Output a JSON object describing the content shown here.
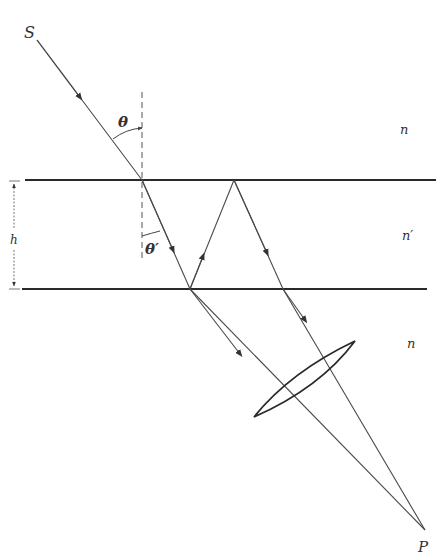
{
  "diagram": {
    "type": "optics-ray-diagram",
    "labels": {
      "source": "S",
      "image_point": "P",
      "incident_angle": "θ",
      "refracted_angle": "θ′",
      "thickness": "h",
      "medium_top": "n",
      "medium_slab": "n′",
      "medium_bottom": "n"
    },
    "colors": {
      "line": "#2a2a2a",
      "ray": "#4a4a4a",
      "background": "#ffffff"
    },
    "geometry": {
      "top_interface_y": 180,
      "bottom_interface_y": 289,
      "source": [
        108,
        40
      ],
      "entry_point": [
        142,
        180
      ],
      "first_bottom_hit": [
        190,
        289
      ],
      "top_apex": [
        234,
        180
      ],
      "second_bottom_exit": [
        283,
        289
      ],
      "focus_point": [
        425,
        530
      ],
      "lens_tips": [
        [
          254,
          417
        ],
        [
          355,
          341
        ]
      ]
    }
  }
}
